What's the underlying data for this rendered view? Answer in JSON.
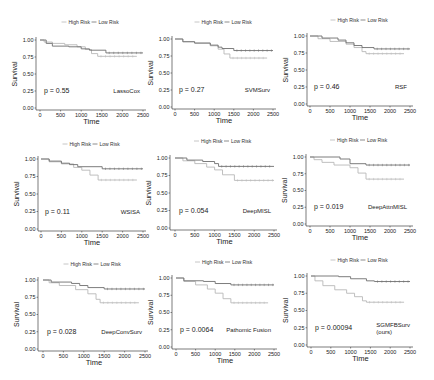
{
  "colors": {
    "high_risk": "#b8b8b8",
    "low_risk": "#6e6e6e",
    "axis": "#222222"
  },
  "chart_data": [
    {
      "type": "line",
      "title": "LassoCox",
      "p_value": "p = 0.55",
      "xlabel": "Time",
      "ylabel": "Survival",
      "xlim": [
        0,
        2500
      ],
      "ylim": [
        0,
        1
      ],
      "xticks": [
        "0",
        "500",
        "1000",
        "1500",
        "2000",
        "2500"
      ],
      "yticks": [
        "0.00",
        "0.25",
        "0.50",
        "0.75",
        "1.00"
      ],
      "legend": [
        "High Risk",
        "Low Risk"
      ],
      "frame": {
        "ax": 36,
        "x0": 40,
        "x1": 143,
        "ytop": 40,
        "ybot": 108,
        "legendY": 22
      },
      "series": [
        {
          "name": "High Risk",
          "steps": [
            [
              0,
              1.0
            ],
            [
              100,
              0.97
            ],
            [
              300,
              0.95
            ],
            [
              600,
              0.93
            ],
            [
              900,
              0.9
            ],
            [
              1100,
              0.86
            ],
            [
              1250,
              0.8
            ],
            [
              1400,
              0.76
            ],
            [
              2350,
              0.76
            ]
          ]
        },
        {
          "name": "Low Risk",
          "steps": [
            [
              0,
              1.0
            ],
            [
              150,
              0.95
            ],
            [
              300,
              0.91
            ],
            [
              700,
              0.9
            ],
            [
              1000,
              0.87
            ],
            [
              1200,
              0.85
            ],
            [
              1600,
              0.81
            ],
            [
              2500,
              0.81
            ]
          ]
        }
      ]
    },
    {
      "type": "line",
      "title": "SVMSurv",
      "p_value": "p = 0.27",
      "xlabel": "Time",
      "ylabel": "Survival",
      "xlim": [
        0,
        2500
      ],
      "ylim": [
        0,
        1
      ],
      "xticks": [
        "0",
        "500",
        "1000",
        "1500",
        "2000",
        "2500"
      ],
      "yticks": [
        "0.00",
        "0.25",
        "0.50",
        "0.75",
        "1.00"
      ],
      "legend": [
        "High Risk",
        "Low Risk"
      ],
      "frame": {
        "ax": 172,
        "x0": 175,
        "x1": 273,
        "ytop": 39,
        "ybot": 107,
        "legendY": 22
      },
      "series": [
        {
          "name": "High Risk",
          "steps": [
            [
              0,
              1.0
            ],
            [
              200,
              0.96
            ],
            [
              500,
              0.94
            ],
            [
              900,
              0.9
            ],
            [
              1100,
              0.85
            ],
            [
              1250,
              0.78
            ],
            [
              1400,
              0.72
            ],
            [
              2350,
              0.72
            ]
          ]
        },
        {
          "name": "Low Risk",
          "steps": [
            [
              0,
              1.0
            ],
            [
              200,
              0.96
            ],
            [
              500,
              0.94
            ],
            [
              900,
              0.91
            ],
            [
              1100,
              0.88
            ],
            [
              1200,
              0.86
            ],
            [
              1500,
              0.83
            ],
            [
              2500,
              0.83
            ]
          ]
        }
      ]
    },
    {
      "type": "line",
      "title": "RSF",
      "p_value": "p = 0.46",
      "xlabel": "Time",
      "ylabel": "Survival",
      "xlim": [
        0,
        2500
      ],
      "ylim": [
        0,
        1
      ],
      "xticks": [
        "0",
        "500",
        "1000",
        "1500",
        "2000",
        "2500"
      ],
      "yticks": [
        "0.00",
        "0.25",
        "0.50",
        "0.75",
        "1.00"
      ],
      "legend": [
        "High Risk",
        "Low Risk"
      ],
      "frame": {
        "ax": 307,
        "x0": 310,
        "x1": 410,
        "ytop": 36,
        "ybot": 104,
        "legendY": 20
      },
      "series": [
        {
          "name": "High Risk",
          "steps": [
            [
              0,
              1.0
            ],
            [
              200,
              0.96
            ],
            [
              500,
              0.92
            ],
            [
              900,
              0.88
            ],
            [
              1100,
              0.83
            ],
            [
              1300,
              0.77
            ],
            [
              1400,
              0.74
            ],
            [
              2350,
              0.74
            ]
          ]
        },
        {
          "name": "Low Risk",
          "steps": [
            [
              0,
              1.0
            ],
            [
              300,
              0.97
            ],
            [
              700,
              0.94
            ],
            [
              900,
              0.9
            ],
            [
              1100,
              0.86
            ],
            [
              1300,
              0.83
            ],
            [
              1600,
              0.81
            ],
            [
              2500,
              0.81
            ]
          ]
        }
      ]
    },
    {
      "type": "line",
      "title": "WSISA",
      "p_value": "p = 0.11",
      "xlabel": "Time",
      "ylabel": "Survival",
      "xlim": [
        0,
        2500
      ],
      "ylim": [
        0,
        1
      ],
      "xticks": [
        "0",
        "500",
        "1000",
        "1500",
        "2000",
        "2500"
      ],
      "yticks": [
        "0.00",
        "0.25",
        "0.50",
        "0.75",
        "1.00"
      ],
      "legend": [
        "High Risk",
        "Low Risk"
      ],
      "frame": {
        "ax": 38,
        "x0": 41,
        "x1": 143,
        "ytop": 159,
        "ybot": 229,
        "legendY": 144
      },
      "series": [
        {
          "name": "High Risk",
          "steps": [
            [
              0,
              1.0
            ],
            [
              200,
              0.96
            ],
            [
              500,
              0.93
            ],
            [
              800,
              0.88
            ],
            [
              1000,
              0.84
            ],
            [
              1200,
              0.77
            ],
            [
              1400,
              0.7
            ],
            [
              2350,
              0.7
            ]
          ]
        },
        {
          "name": "Low Risk",
          "steps": [
            [
              0,
              1.0
            ],
            [
              200,
              0.97
            ],
            [
              500,
              0.94
            ],
            [
              700,
              0.92
            ],
            [
              900,
              0.89
            ],
            [
              1500,
              0.86
            ],
            [
              2500,
              0.86
            ]
          ]
        }
      ]
    },
    {
      "type": "line",
      "title": "DeepMISL",
      "p_value": "p = 0.054",
      "xlabel": "Time",
      "ylabel": "Survival",
      "xlim": [
        0,
        2500
      ],
      "ylim": [
        0,
        1
      ],
      "xticks": [
        "0",
        "500",
        "1000",
        "1500",
        "2000",
        "2500"
      ],
      "yticks": [
        "0.00",
        "0.25",
        "0.50",
        "0.75",
        "1.00"
      ],
      "legend": [
        "High Risk",
        "Low Risk"
      ],
      "frame": {
        "ax": 170,
        "x0": 175,
        "x1": 274,
        "ytop": 158,
        "ybot": 228,
        "legendY": 141
      },
      "series": [
        {
          "name": "High Risk",
          "steps": [
            [
              0,
              1.0
            ],
            [
              200,
              0.96
            ],
            [
              500,
              0.92
            ],
            [
              800,
              0.87
            ],
            [
              1000,
              0.83
            ],
            [
              1200,
              0.76
            ],
            [
              1500,
              0.68
            ],
            [
              2500,
              0.68
            ]
          ]
        },
        {
          "name": "Low Risk",
          "steps": [
            [
              0,
              1.0
            ],
            [
              300,
              0.97
            ],
            [
              700,
              0.95
            ],
            [
              1000,
              0.92
            ],
            [
              1100,
              0.88
            ],
            [
              2500,
              0.88
            ]
          ]
        }
      ]
    },
    {
      "type": "line",
      "title": "DeepAttnMISL",
      "p_value": "p = 0.019",
      "xlabel": "Time",
      "ylabel": "Survival",
      "xlim": [
        0,
        2500
      ],
      "ylim": [
        0,
        1
      ],
      "xticks": [
        "0",
        "500",
        "1000",
        "1500",
        "2000",
        "2500"
      ],
      "yticks": [
        "0.00",
        "0.25",
        "0.50",
        "0.75",
        "1.00"
      ],
      "legend": [
        "High Risk",
        "Low Risk"
      ],
      "frame": {
        "ax": 306,
        "x0": 310,
        "x1": 410,
        "ytop": 157,
        "ybot": 224,
        "legendY": 140
      },
      "series": [
        {
          "name": "High Risk",
          "steps": [
            [
              0,
              1.0
            ],
            [
              100,
              0.96
            ],
            [
              300,
              0.92
            ],
            [
              600,
              0.88
            ],
            [
              1000,
              0.84
            ],
            [
              1200,
              0.76
            ],
            [
              1400,
              0.67
            ],
            [
              2350,
              0.67
            ]
          ]
        },
        {
          "name": "Low Risk",
          "steps": [
            [
              0,
              1.0
            ],
            [
              750,
              0.97
            ],
            [
              1000,
              0.9
            ],
            [
              1400,
              0.88
            ],
            [
              2500,
              0.88
            ]
          ]
        }
      ]
    },
    {
      "type": "line",
      "title": "DeepConvSurv",
      "p_value": "p = 0.028",
      "xlabel": "Time",
      "ylabel": "Survival",
      "xlim": [
        0,
        2500
      ],
      "ylim": [
        0,
        1
      ],
      "xticks": [
        "0",
        "500",
        "1000",
        "1500",
        "2000",
        "2500"
      ],
      "yticks": [
        "0.00",
        "0.25",
        "0.50",
        "0.75",
        "1.00"
      ],
      "legend": [
        "High Risk",
        "Low Risk"
      ],
      "frame": {
        "ax": 38,
        "x0": 43,
        "x1": 145,
        "ytop": 280,
        "ybot": 349,
        "legendY": 264
      },
      "series": [
        {
          "name": "High Risk",
          "steps": [
            [
              0,
              1.0
            ],
            [
              150,
              0.96
            ],
            [
              400,
              0.92
            ],
            [
              800,
              0.86
            ],
            [
              1100,
              0.8
            ],
            [
              1300,
              0.72
            ],
            [
              1400,
              0.67
            ],
            [
              2350,
              0.67
            ]
          ]
        },
        {
          "name": "Low Risk",
          "steps": [
            [
              0,
              1.0
            ],
            [
              200,
              0.97
            ],
            [
              700,
              0.95
            ],
            [
              900,
              0.92
            ],
            [
              1100,
              0.89
            ],
            [
              1500,
              0.87
            ],
            [
              2500,
              0.87
            ]
          ]
        }
      ]
    },
    {
      "type": "line",
      "title": "Pathomic Fusion",
      "p_value": "p = 0.0064",
      "xlabel": "Time",
      "ylabel": "Survival",
      "xlim": [
        0,
        2500
      ],
      "ylim": [
        0,
        1
      ],
      "xticks": [
        "0",
        "500",
        "1000",
        "1500",
        "2000",
        "2500"
      ],
      "yticks": [
        "0.00",
        "0.25",
        "0.50",
        "0.75",
        "1.00"
      ],
      "legend": [
        "High Risk",
        "Low Risk"
      ],
      "frame": {
        "ax": 172,
        "x0": 176,
        "x1": 274,
        "ytop": 278,
        "ybot": 347,
        "legendY": 262
      },
      "series": [
        {
          "name": "High Risk",
          "steps": [
            [
              0,
              1.0
            ],
            [
              200,
              0.95
            ],
            [
              500,
              0.9
            ],
            [
              800,
              0.84
            ],
            [
              1000,
              0.78
            ],
            [
              1200,
              0.7
            ],
            [
              1400,
              0.64
            ],
            [
              2350,
              0.64
            ]
          ]
        },
        {
          "name": "Low Risk",
          "steps": [
            [
              0,
              1.0
            ],
            [
              200,
              0.96
            ],
            [
              700,
              0.95
            ],
            [
              1000,
              0.92
            ],
            [
              1400,
              0.9
            ],
            [
              2500,
              0.9
            ]
          ]
        }
      ]
    },
    {
      "type": "line",
      "title": "SGMFBSurv (ours)",
      "p_value": "p = 0.00094",
      "xlabel": "Time",
      "ylabel": "Survival",
      "xlim": [
        0,
        2500
      ],
      "ylim": [
        0,
        1
      ],
      "xticks": [
        "0",
        "500",
        "1000",
        "1500",
        "2000",
        "2500"
      ],
      "yticks": [
        "0.00",
        "0.25",
        "0.50",
        "0.75",
        "1.00"
      ],
      "legend": [
        "High Risk",
        "Low Risk"
      ],
      "frame": {
        "ax": 307,
        "x0": 311,
        "x1": 410,
        "ytop": 276,
        "ybot": 345,
        "legendY": 260
      },
      "series": [
        {
          "name": "High Risk",
          "steps": [
            [
              0,
              1.0
            ],
            [
              100,
              0.93
            ],
            [
              300,
              0.86
            ],
            [
              600,
              0.8
            ],
            [
              900,
              0.75
            ],
            [
              1100,
              0.7
            ],
            [
              1300,
              0.64
            ],
            [
              1400,
              0.62
            ],
            [
              2350,
              0.62
            ]
          ]
        },
        {
          "name": "Low Risk",
          "steps": [
            [
              0,
              1.0
            ],
            [
              700,
              0.99
            ],
            [
              1000,
              0.96
            ],
            [
              1400,
              0.93
            ],
            [
              1600,
              0.92
            ],
            [
              2500,
              0.92
            ]
          ]
        }
      ]
    }
  ]
}
